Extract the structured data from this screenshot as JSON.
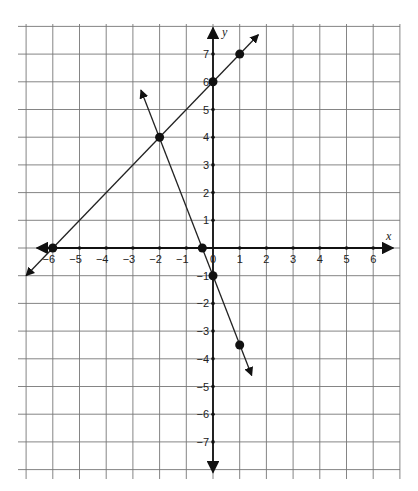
{
  "chart_data": {
    "type": "line",
    "title": "",
    "xlabel": "x",
    "ylabel": "y",
    "xlim": [
      -7,
      7
    ],
    "ylim": [
      -8,
      8
    ],
    "grid": true,
    "x_ticks": [
      -6,
      -5,
      -4,
      -3,
      -2,
      -1,
      0,
      1,
      2,
      3,
      4,
      5,
      6
    ],
    "y_ticks": [
      -7,
      -6,
      -5,
      -4,
      -3,
      -2,
      -1,
      1,
      2,
      3,
      4,
      5,
      6,
      7
    ],
    "x_tick_labels": [
      "−6",
      "−5",
      "−4",
      "−3",
      "−2",
      "−1",
      "0",
      "1",
      "2",
      "3",
      "4",
      "5",
      "6"
    ],
    "y_tick_labels": [
      "−7",
      "−6",
      "−5",
      "−4",
      "−3",
      "−2",
      "−1",
      "1",
      "2",
      "3",
      "4",
      "5",
      "6",
      "7"
    ],
    "series": [
      {
        "name": "line 1 (y = x + 6)",
        "points": [
          [
            -6,
            0
          ],
          [
            -2,
            4
          ],
          [
            0,
            6
          ],
          [
            1,
            7
          ]
        ],
        "extends_arrows": [
          [
            -7,
            -1
          ],
          [
            1.7,
            7.7
          ]
        ]
      },
      {
        "name": "line 2 (y = -2.5x - 1)",
        "points": [
          [
            -2,
            4
          ],
          [
            -0.4,
            0
          ],
          [
            0,
            -1
          ],
          [
            1,
            -3.5
          ]
        ],
        "extends_arrows": [
          [
            -2.7,
            5.7
          ],
          [
            1.45,
            -4.6
          ]
        ]
      }
    ],
    "marked_points": [
      [
        -6,
        0
      ],
      [
        -2,
        4
      ],
      [
        0,
        6
      ],
      [
        1,
        7
      ],
      [
        -0.4,
        0
      ],
      [
        0,
        -1
      ],
      [
        1,
        -3.5
      ]
    ]
  }
}
